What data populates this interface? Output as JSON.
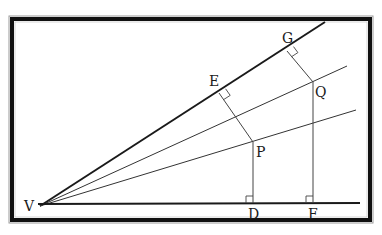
{
  "diagram": {
    "labels": {
      "V": "V",
      "E": "E",
      "G": "G",
      "P": "P",
      "Q": "Q",
      "D": "D",
      "F": "F"
    },
    "points": {
      "V": [
        40,
        206
      ],
      "E": [
        219,
        93
      ],
      "G": [
        287,
        51
      ],
      "P": [
        253,
        142
      ],
      "Q": [
        313,
        82
      ],
      "D": [
        253,
        203
      ],
      "F": [
        313,
        203
      ]
    },
    "rays": [
      {
        "name": "upper-ray",
        "from": "V",
        "to": [
          325,
          22
        ],
        "weight": "thick"
      },
      {
        "name": "bisector-upper",
        "from": "V",
        "to": [
          347,
          66
        ],
        "weight": "thin"
      },
      {
        "name": "bisector-lower",
        "from": "V",
        "to": [
          356,
          110
        ],
        "weight": "thin"
      },
      {
        "name": "base-ray",
        "from": "V",
        "to": [
          360,
          203
        ],
        "weight": "thick"
      }
    ],
    "perpendiculars": [
      {
        "from": "P",
        "to": "E"
      },
      {
        "from": "P",
        "to": "D"
      },
      {
        "from": "Q",
        "to": "G"
      },
      {
        "from": "Q",
        "to": "F"
      }
    ],
    "colors": {
      "line": "#1a1a1a",
      "frame": "#111111",
      "background": "#ffffff"
    }
  }
}
